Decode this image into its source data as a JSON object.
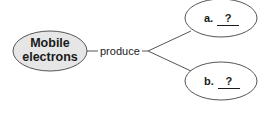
{
  "diagram": {
    "type": "concept-map",
    "central_node": {
      "label_line1": "Mobile",
      "label_line2": "electrons",
      "fill": "#e6e6e6"
    },
    "link": {
      "label": "produce"
    },
    "branches": [
      {
        "letter": "a.",
        "answer": "?"
      },
      {
        "letter": "b.",
        "answer": "?"
      }
    ],
    "colors": {
      "stroke": "#555555",
      "central_fill": "#e6e6e6",
      "branch_fill": "#ffffff"
    }
  }
}
